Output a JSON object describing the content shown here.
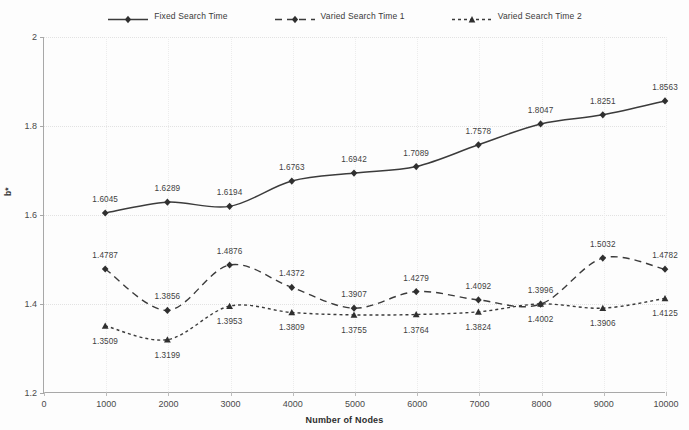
{
  "chart_data": {
    "type": "line",
    "title": "",
    "xlabel": "Number of Nodes",
    "ylabel": "b*",
    "xlim": [
      0,
      10000
    ],
    "ylim": [
      1.2,
      2.0
    ],
    "xticks": [
      0,
      1000,
      2000,
      3000,
      4000,
      5000,
      6000,
      7000,
      8000,
      9000,
      10000
    ],
    "xtick_labels": [
      "0",
      "1000",
      "2000",
      "3000",
      "4000",
      "5000",
      "6000",
      "7000",
      "8000",
      "9000",
      "10000"
    ],
    "yticks": [
      1.2,
      1.4,
      1.6,
      1.8,
      2.0
    ],
    "ytick_labels": [
      "1.2",
      "1.4",
      "1.6",
      "1.8",
      "2"
    ],
    "grid": true,
    "legend_position": "top-center",
    "x": [
      1000,
      2000,
      3000,
      4000,
      5000,
      6000,
      7000,
      8000,
      9000,
      10000
    ],
    "series": [
      {
        "name": "Fixed Search Time",
        "marker": "diamond",
        "dash": "solid",
        "color": "#3b3b3b",
        "values": [
          1.6045,
          1.6289,
          1.6194,
          1.6763,
          1.6942,
          1.7089,
          1.7578,
          1.8047,
          1.8251,
          1.8563
        ],
        "labels": [
          "1.6045",
          "1.6289",
          "1.6194",
          "1.6763",
          "1.6942",
          "1.7089",
          "1.7578",
          "1.8047",
          "1.8251",
          "1.8563"
        ],
        "label_side": [
          "above",
          "above",
          "above",
          "above",
          "above",
          "above",
          "above",
          "above",
          "above",
          "above"
        ]
      },
      {
        "name": "Varied Search Time 1",
        "marker": "diamond",
        "dash": "dashed",
        "color": "#3b3b3b",
        "values": [
          1.4787,
          1.3856,
          1.4876,
          1.4372,
          1.3907,
          1.4279,
          1.4092,
          1.3996,
          1.5032,
          1.4782
        ],
        "labels": [
          "1.4787",
          "1.3856",
          "1.4876",
          "1.4372",
          "1.3907",
          "1.4279",
          "1.4092",
          "1.3996",
          "1.5032",
          "1.4782"
        ],
        "label_side": [
          "above",
          "above",
          "above",
          "above",
          "above",
          "above",
          "above",
          "above",
          "above",
          "above"
        ]
      },
      {
        "name": "Varied Search Time 2",
        "marker": "triangle",
        "dash": "dotted",
        "color": "#3b3b3b",
        "values": [
          1.3509,
          1.3199,
          1.3953,
          1.3809,
          1.3755,
          1.3764,
          1.3824,
          1.4002,
          1.3906,
          1.4125
        ],
        "labels": [
          "1.3509",
          "1.3199",
          "1.3953",
          "1.3809",
          "1.3755",
          "1.3764",
          "1.3824",
          "1.4002",
          "1.3906",
          "1.4125"
        ],
        "label_side": [
          "below",
          "below",
          "below",
          "below",
          "below",
          "below",
          "below",
          "below",
          "below",
          "below"
        ]
      }
    ]
  },
  "legend": {
    "items": [
      {
        "label": "Fixed Search Time"
      },
      {
        "label": "Varied Search Time 1"
      },
      {
        "label": "Varied Search Time 2"
      }
    ]
  },
  "axes": {
    "x_title": "Number of Nodes",
    "y_title": "b*"
  }
}
